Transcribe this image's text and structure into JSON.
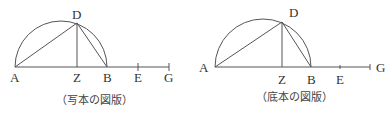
{
  "figures": [
    {
      "id": "manuscript",
      "caption": "（写本の図版）",
      "labels": {
        "A": "A",
        "D": "D",
        "Z": "Z",
        "B": "B",
        "E": "E",
        "G": "G"
      }
    },
    {
      "id": "base-text",
      "caption": "（底本の図版）",
      "labels": {
        "A": "A",
        "D": "D",
        "Z": "Z",
        "B": "B",
        "E": "E",
        "G": "G"
      }
    }
  ]
}
